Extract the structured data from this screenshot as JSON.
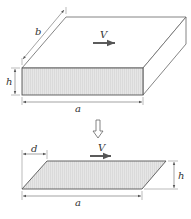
{
  "diagram": {
    "top_figure": {
      "description": "rectangular block moving with velocity V",
      "labels": {
        "width": "b",
        "height": "h",
        "length": "a",
        "velocity": "V"
      }
    },
    "transition_arrow": "hollow-down-arrow",
    "bottom_figure": {
      "description": "sheared parallelogram cross-section",
      "labels": {
        "offset": "d",
        "height": "h",
        "length": "a",
        "velocity": "V"
      }
    },
    "colors": {
      "stroke": "#555555",
      "fill_face": "#e4e4e4",
      "fill_top": "#ffffff"
    }
  }
}
